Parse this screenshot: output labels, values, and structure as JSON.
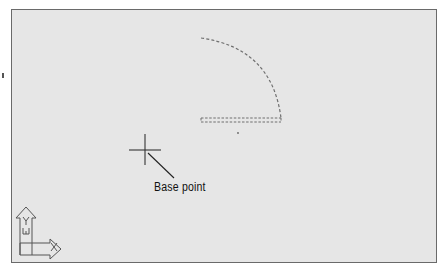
{
  "viewport": {
    "background": "#e6e6e6",
    "border_color": "#6a6a6a"
  },
  "drawing": {
    "ghost_object": {
      "type": "arc-with-rectangle",
      "style": "dashed",
      "color": "#666666"
    },
    "crosshair": {
      "name": "cursor-crosshair"
    },
    "callout": {
      "label": "Base point"
    }
  },
  "ucs_icon": {
    "x_label": "X",
    "y_label": "Y",
    "w_label": "W"
  }
}
